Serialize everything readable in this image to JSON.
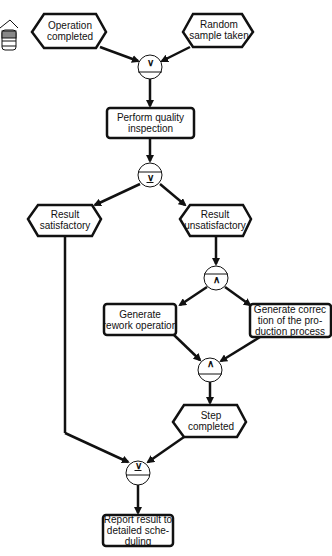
{
  "diagram": {
    "events": {
      "operation_completed": "Operation\ncompleted",
      "random_sample_taken": "Random\nsample taken",
      "result_satisfactory": "Result\nsatisfactory",
      "result_unsatisfactory": "Result\nunsatisfactory",
      "step_completed": "Step\ncompleted"
    },
    "functions": {
      "perform_quality_inspection": "Perform quality\ninspection",
      "generate_rework_operation": "Generate\nrework operation",
      "generate_correction": "Generate correc\ntion of the pro-\nduction process",
      "report_result": "Report result to\ndetailed sche-\nduling"
    },
    "connectors": {
      "or_join_top": "∨",
      "xor_split": "∨",
      "and_split": "∧",
      "and_join": "∧",
      "xor_join": "∨"
    },
    "colors": {
      "stroke": "#111111",
      "fill": "#ffffff"
    }
  }
}
